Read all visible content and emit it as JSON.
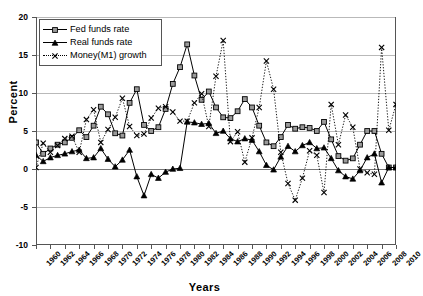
{
  "chart_title": "(Percent per annum)",
  "axis": {
    "ylabel": "Percent",
    "xlabel": "Years",
    "ylim": [
      -10,
      20
    ],
    "yticks": [
      20,
      15,
      10,
      5,
      0,
      -5,
      -10
    ],
    "xlim": [
      1960,
      2010
    ],
    "xticks": [
      1960,
      1962,
      1964,
      1966,
      1968,
      1970,
      1972,
      1974,
      1976,
      1978,
      1980,
      1982,
      1984,
      1986,
      1988,
      1990,
      1992,
      1994,
      1996,
      1998,
      2000,
      2002,
      2004,
      2006,
      2008,
      2010
    ],
    "grid": true
  },
  "legend": {
    "position": "top-left",
    "items": [
      {
        "label": "Fed funds rate",
        "marker": "square",
        "line": "solid"
      },
      {
        "label": "Real funds rate",
        "marker": "triangle",
        "line": "solid"
      },
      {
        "label": "Money(M1) growth",
        "marker": "cross",
        "line": "dotted"
      }
    ]
  },
  "chart_data": {
    "type": "line",
    "title": "(Percent per annum)",
    "xlabel": "Years",
    "ylabel": "Percent",
    "ylim": [
      -10,
      20
    ],
    "xlim": [
      1960,
      2010
    ],
    "grid": true,
    "x": [
      1960,
      1961,
      1962,
      1963,
      1964,
      1965,
      1966,
      1967,
      1968,
      1969,
      1970,
      1971,
      1972,
      1973,
      1974,
      1975,
      1976,
      1977,
      1978,
      1979,
      1980,
      1981,
      1982,
      1983,
      1984,
      1985,
      1986,
      1987,
      1988,
      1989,
      1990,
      1991,
      1992,
      1993,
      1994,
      1995,
      1996,
      1997,
      1998,
      1999,
      2000,
      2001,
      2002,
      2003,
      2004,
      2005,
      2006,
      2007,
      2008,
      2009,
      2010
    ],
    "series": [
      {
        "name": "Fed funds rate",
        "marker": "square",
        "line": "solid",
        "values": [
          3.5,
          2.0,
          2.7,
          3.2,
          3.5,
          4.1,
          5.1,
          4.2,
          5.7,
          8.2,
          7.2,
          4.7,
          4.4,
          8.7,
          10.5,
          5.8,
          5.0,
          5.5,
          7.9,
          11.2,
          13.4,
          16.4,
          12.3,
          9.1,
          10.2,
          8.1,
          6.8,
          6.7,
          7.6,
          9.2,
          8.1,
          5.7,
          3.5,
          3.0,
          4.2,
          5.8,
          5.3,
          5.5,
          5.4,
          5.0,
          6.2,
          3.9,
          1.7,
          1.1,
          1.4,
          3.2,
          5.0,
          5.0,
          2.0,
          0.2,
          0.2
        ]
      },
      {
        "name": "Real funds rate",
        "marker": "triangle",
        "line": "solid",
        "values": [
          1.8,
          1.0,
          1.5,
          1.8,
          2.0,
          2.3,
          2.5,
          1.4,
          1.5,
          2.7,
          1.3,
          0.3,
          1.2,
          2.5,
          -1.0,
          -3.5,
          -0.7,
          -1.2,
          -0.4,
          0.0,
          0.1,
          6.2,
          6.1,
          5.9,
          6.0,
          4.7,
          5.0,
          4.0,
          3.6,
          4.0,
          3.8,
          2.3,
          0.5,
          -0.1,
          1.6,
          3.0,
          2.3,
          3.1,
          3.5,
          2.7,
          2.8,
          1.4,
          -0.2,
          -1.0,
          -1.3,
          -0.2,
          1.5,
          2.0,
          -1.8,
          0.2,
          0.2
        ]
      },
      {
        "name": "Money(M1) growth",
        "marker": "cross",
        "line": "dotted",
        "values": [
          0.2,
          3.4,
          2.2,
          3.1,
          4.0,
          4.3,
          2.2,
          6.5,
          7.8,
          3.5,
          5.2,
          6.8,
          9.3,
          5.6,
          4.4,
          4.6,
          6.7,
          8.0,
          8.2,
          7.5,
          6.3,
          6.3,
          8.7,
          9.9,
          5.6,
          12.2,
          16.9,
          3.6,
          4.9,
          0.9,
          4.1,
          8.1,
          14.2,
          10.5,
          2.2,
          -1.9,
          -4.1,
          -1.2,
          2.4,
          1.8,
          -3.1,
          8.5,
          3.2,
          7.1,
          5.5,
          0.0,
          -0.5,
          -0.7,
          16.0,
          5.1,
          8.5
        ]
      }
    ]
  }
}
